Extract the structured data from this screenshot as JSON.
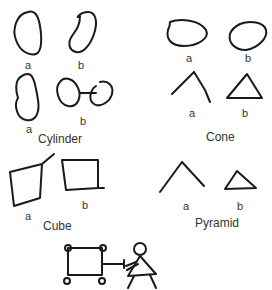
{
  "groups": [
    {
      "title": "Cylinder",
      "labels": [
        "a",
        "b",
        "a",
        "b"
      ]
    },
    {
      "title": "Cone",
      "labels": [
        "a",
        "b",
        "a",
        "b"
      ]
    },
    {
      "title": "Cube",
      "labels": [
        "a",
        "b"
      ]
    },
    {
      "title": "Pyramid",
      "labels": [
        "a",
        "b"
      ]
    }
  ],
  "stroke_color": "#1a1a1a"
}
